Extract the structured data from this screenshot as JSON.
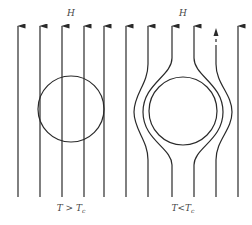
{
  "figure": {
    "panels": [
      {
        "id": "normal",
        "field_label": "H",
        "condition": {
          "T": "T",
          "op": " > ",
          "Tc": "T",
          "Tc_sub": "c"
        },
        "description": "Magnetic field lines pass straight through the sphere above critical temperature"
      },
      {
        "id": "superconducting",
        "field_label": "H",
        "condition": {
          "T": "T",
          "op": "<",
          "Tc": "T",
          "Tc_sub": "c"
        },
        "description": "Field lines are expelled and bend around the sphere below critical temperature (Meissner effect)"
      }
    ],
    "colors": {
      "line": "#2a2a2a",
      "text": "#444444",
      "background": "#ffffff"
    }
  }
}
